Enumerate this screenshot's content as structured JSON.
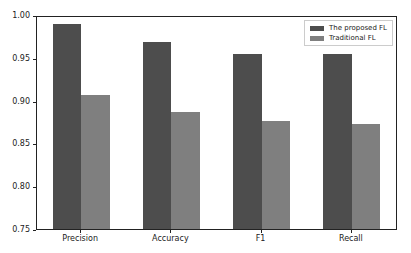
{
  "chart_data": {
    "type": "bar",
    "title": "",
    "xlabel": "",
    "ylabel": "",
    "categories": [
      "Precision",
      "Accuracy",
      "F1",
      "Recall"
    ],
    "series": [
      {
        "name": "The proposed FL",
        "color": "#4d4d4d",
        "values": [
          0.989,
          0.968,
          0.954,
          0.954
        ]
      },
      {
        "name": "Traditional FL",
        "color": "#7f7f7f",
        "values": [
          0.907,
          0.887,
          0.876,
          0.873
        ]
      }
    ],
    "ylim": [
      0.75,
      1.0
    ],
    "yticks": [
      "0.75",
      "0.80",
      "0.85",
      "0.90",
      "0.95",
      "1.00"
    ],
    "grid": false,
    "legend_position": "upper right"
  }
}
